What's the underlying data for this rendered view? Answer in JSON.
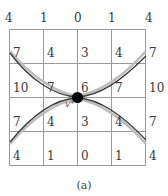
{
  "grid": {
    "values": [
      [
        "4",
        "1",
        "0",
        "1",
        "4"
      ],
      [
        "7",
        "4",
        "3",
        "4",
        "7"
      ],
      [
        "10",
        "7",
        "6",
        "7",
        "10"
      ],
      [
        "7",
        "4",
        "3",
        "4",
        "7"
      ],
      [
        "4",
        "1",
        "0",
        "1",
        "4"
      ]
    ]
  },
  "point_label": "v*",
  "caption": "(a)",
  "colors": {
    "grid_line": "#9a9a9a",
    "curve_dark": "#3c3c3c",
    "curve_light": "#bdbdbd",
    "point": "#000000"
  }
}
